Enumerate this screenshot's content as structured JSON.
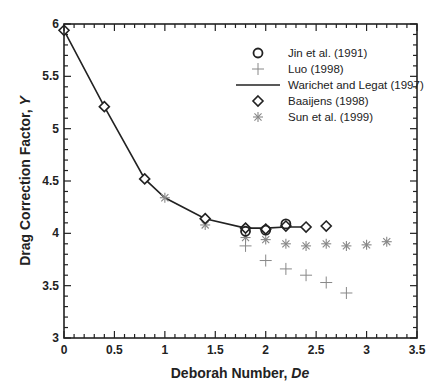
{
  "chart_data": {
    "type": "scatter",
    "title": "",
    "xlabel": "Deborah Number, ",
    "xlabel_italic": "De",
    "ylabel": "Drag Correction Factor, ",
    "ylabel_italic": "Y",
    "xlim": [
      0,
      3.5
    ],
    "ylim": [
      3,
      6
    ],
    "xticks": [
      0,
      0.5,
      1,
      1.5,
      2,
      2.5,
      3,
      3.5
    ],
    "xtick_labels": [
      "0",
      "0.5",
      "1",
      "1.5",
      "2",
      "2.5",
      "3",
      "3.5"
    ],
    "yticks": [
      3,
      3.5,
      4,
      4.5,
      5,
      5.5,
      6
    ],
    "ytick_labels": [
      "3",
      "3.5",
      "4",
      "4.5",
      "5",
      "5.5",
      "6"
    ],
    "grid": false,
    "legend_position": "upper right",
    "series": [
      {
        "name": "Jin et al. (1991)",
        "marker": "circle",
        "color": "#222222",
        "x": [
          1.8,
          2.0,
          2.2
        ],
        "y": [
          4.02,
          4.03,
          4.09
        ]
      },
      {
        "name": "Luo (1998)",
        "marker": "plus",
        "color": "#888888",
        "x": [
          1.8,
          2.0,
          2.2,
          2.4,
          2.6,
          2.8
        ],
        "y": [
          3.88,
          3.74,
          3.66,
          3.6,
          3.53,
          3.43
        ]
      },
      {
        "name": "Warichet and Legat (1997)",
        "marker": "line",
        "color": "#222222",
        "x": [
          0,
          0.4,
          0.8,
          1.0,
          1.4,
          1.8,
          2.0,
          2.2,
          2.4
        ],
        "y": [
          5.94,
          5.21,
          4.52,
          4.34,
          4.14,
          4.05,
          4.05,
          4.06,
          4.06
        ]
      },
      {
        "name": "Baaijens (1998)",
        "marker": "diamond",
        "color": "#222222",
        "x": [
          0,
          0.4,
          0.8,
          1.4,
          1.8,
          2.0,
          2.2,
          2.4,
          2.6
        ],
        "y": [
          5.94,
          5.21,
          4.52,
          4.14,
          4.05,
          4.04,
          4.07,
          4.06,
          4.07
        ]
      },
      {
        "name": "Sun et al. (1999)",
        "marker": "asterisk",
        "color": "#888888",
        "x": [
          1.0,
          1.4,
          1.8,
          2.0,
          2.2,
          2.4,
          2.6,
          2.8,
          3.0,
          3.2
        ],
        "y": [
          4.34,
          4.08,
          3.96,
          3.94,
          3.9,
          3.88,
          3.9,
          3.88,
          3.89,
          3.92
        ]
      }
    ]
  },
  "legend": {
    "items": [
      {
        "label": "Jin et al. (1991)",
        "marker": "circle"
      },
      {
        "label": "Luo (1998)",
        "marker": "plus"
      },
      {
        "label": "Warichet and Legat (1997)",
        "marker": "line"
      },
      {
        "label": "Baaijens (1998)",
        "marker": "diamond"
      },
      {
        "label": "Sun et al. (1999)",
        "marker": "asterisk"
      }
    ]
  },
  "colors": {
    "axis": "#222222",
    "dark_marker": "#222222",
    "light_marker": "#888888"
  }
}
